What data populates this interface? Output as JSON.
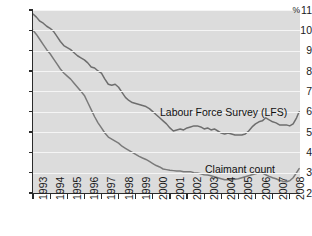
{
  "chart_data": {
    "type": "line",
    "title": "",
    "xlabel": "",
    "ylabel": "%",
    "unit": "%",
    "grid": true,
    "legend_position": "inline-annotation",
    "xlim": [
      1993,
      2008.6
    ],
    "ylim": [
      2,
      11
    ],
    "yticks": [
      2,
      3,
      4,
      5,
      6,
      7,
      8,
      9,
      10,
      11
    ],
    "ytick_labels": [
      "2",
      "3",
      "4",
      "5",
      "6",
      "7",
      "8",
      "9",
      "10",
      "11"
    ],
    "y_axis_unit_prefix": "%",
    "xticks": [
      1993,
      1994,
      1995,
      1996,
      1997,
      1998,
      1999,
      2000,
      2001,
      2002,
      2003,
      2004,
      2005,
      2006,
      2007,
      2008
    ],
    "xtick_labels": [
      "1993",
      "1994",
      "1995",
      "1996",
      "1997",
      "1998",
      "1999",
      "2000",
      "2001",
      "2002",
      "2003",
      "2004",
      "2005",
      "2006",
      "2007",
      "2008"
    ],
    "series": [
      {
        "name": "Labour Force Survey (LFS)",
        "color": "#6e6e6e",
        "label_x": 2000.6,
        "label_y": 6.35,
        "x": [
          1993.0,
          1993.2,
          1993.4,
          1993.6,
          1993.8,
          1994.0,
          1994.2,
          1994.4,
          1994.6,
          1994.8,
          1995.0,
          1995.2,
          1995.4,
          1995.6,
          1995.8,
          1996.0,
          1996.2,
          1996.4,
          1996.6,
          1996.8,
          1997.0,
          1997.2,
          1997.4,
          1997.6,
          1997.8,
          1998.0,
          1998.2,
          1998.4,
          1998.6,
          1998.8,
          1999.0,
          1999.2,
          1999.4,
          1999.6,
          1999.8,
          2000.0,
          2000.2,
          2000.4,
          2000.6,
          2000.8,
          2001.0,
          2001.2,
          2001.4,
          2001.6,
          2001.8,
          2002.0,
          2002.2,
          2002.4,
          2002.6,
          2002.8,
          2003.0,
          2003.2,
          2003.4,
          2003.6,
          2003.8,
          2004.0,
          2004.2,
          2004.4,
          2004.6,
          2004.8,
          2005.0,
          2005.2,
          2005.4,
          2005.6,
          2005.8,
          2006.0,
          2006.2,
          2006.4,
          2006.6,
          2006.8,
          2007.0,
          2007.2,
          2007.4,
          2007.6,
          2007.8,
          2008.0,
          2008.2,
          2008.4,
          2008.55
        ],
        "y": [
          10.8,
          10.65,
          10.45,
          10.35,
          10.2,
          10.1,
          9.95,
          9.7,
          9.45,
          9.25,
          9.15,
          9.05,
          8.9,
          8.75,
          8.65,
          8.55,
          8.4,
          8.2,
          8.15,
          8.0,
          7.9,
          7.6,
          7.35,
          7.3,
          7.35,
          7.2,
          6.95,
          6.7,
          6.55,
          6.45,
          6.4,
          6.35,
          6.3,
          6.25,
          6.15,
          6.0,
          5.85,
          5.7,
          5.55,
          5.4,
          5.2,
          5.05,
          5.1,
          5.15,
          5.1,
          5.2,
          5.25,
          5.3,
          5.3,
          5.25,
          5.15,
          5.2,
          5.1,
          5.15,
          5.05,
          4.95,
          4.9,
          4.95,
          4.9,
          4.85,
          4.85,
          4.85,
          4.9,
          5.05,
          5.25,
          5.4,
          5.5,
          5.55,
          5.7,
          5.6,
          5.5,
          5.45,
          5.35,
          5.35,
          5.35,
          5.3,
          5.4,
          5.7,
          6.0
        ]
      },
      {
        "name": "Claimant count",
        "color": "#7a7a7a",
        "label_x": 2003.6,
        "label_y": 3.45,
        "x": [
          1993.0,
          1993.2,
          1993.4,
          1993.6,
          1993.8,
          1994.0,
          1994.2,
          1994.4,
          1994.6,
          1994.8,
          1995.0,
          1995.2,
          1995.4,
          1995.6,
          1995.8,
          1996.0,
          1996.2,
          1996.4,
          1996.6,
          1996.8,
          1997.0,
          1997.2,
          1997.4,
          1997.6,
          1997.8,
          1998.0,
          1998.2,
          1998.4,
          1998.6,
          1998.8,
          1999.0,
          1999.2,
          1999.4,
          1999.6,
          1999.8,
          2000.0,
          2000.2,
          2000.4,
          2000.6,
          2000.8,
          2001.0,
          2001.2,
          2001.4,
          2001.6,
          2001.8,
          2002.0,
          2002.2,
          2002.4,
          2002.6,
          2002.8,
          2003.0,
          2003.2,
          2003.4,
          2003.6,
          2003.8,
          2004.0,
          2004.2,
          2004.4,
          2004.6,
          2004.8,
          2005.0,
          2005.2,
          2005.4,
          2005.6,
          2005.8,
          2006.0,
          2006.2,
          2006.4,
          2006.6,
          2006.8,
          2007.0,
          2007.2,
          2007.4,
          2007.6,
          2007.8,
          2008.0,
          2008.2,
          2008.4,
          2008.55
        ],
        "y": [
          10.0,
          9.8,
          9.55,
          9.3,
          9.05,
          8.85,
          8.6,
          8.35,
          8.1,
          7.9,
          7.75,
          7.6,
          7.4,
          7.2,
          7.0,
          6.8,
          6.45,
          6.1,
          5.75,
          5.45,
          5.2,
          4.95,
          4.75,
          4.65,
          4.55,
          4.45,
          4.3,
          4.2,
          4.1,
          4.0,
          3.9,
          3.8,
          3.72,
          3.65,
          3.55,
          3.45,
          3.35,
          3.28,
          3.18,
          3.15,
          3.12,
          3.1,
          3.08,
          3.08,
          3.05,
          3.05,
          3.05,
          3.0,
          2.98,
          2.95,
          2.9,
          2.88,
          2.85,
          2.8,
          2.75,
          2.7,
          2.65,
          2.65,
          2.65,
          2.68,
          2.7,
          2.75,
          2.8,
          2.85,
          2.9,
          2.95,
          3.0,
          2.98,
          2.9,
          2.82,
          2.75,
          2.7,
          2.62,
          2.58,
          2.55,
          2.6,
          2.75,
          3.0,
          3.2
        ]
      }
    ]
  },
  "axis": {
    "y_unit": "%",
    "ticks_y": [
      "11",
      "10",
      "9",
      "8",
      "7",
      "6",
      "5",
      "4",
      "3",
      "2"
    ],
    "ticks_x": [
      "1993",
      "1994",
      "1995",
      "1996",
      "1997",
      "1998",
      "1999",
      "2000",
      "2001",
      "2002",
      "2003",
      "2004",
      "2005",
      "2006",
      "2007",
      "2008"
    ]
  },
  "annotations": {
    "lfs_label": "Labour Force Survey (LFS)",
    "claimant_label": "Claimant count"
  },
  "style": {
    "plot_background": "#dcdcdc",
    "gridline_color": "#f5f5f5",
    "axis_color": "#2b2b2b",
    "line_color_lfs": "#6e6e6e",
    "line_color_claimant": "#7a7a7a",
    "page_background": "#ffffff"
  }
}
